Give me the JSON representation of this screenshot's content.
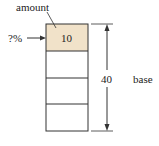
{
  "diagram": {
    "amount_label": "amount",
    "percent_label": "?%",
    "amount_value": "10",
    "base_value": "40",
    "base_label": "base",
    "rows": 4,
    "highlight_color": "#f1e2c9",
    "line_color": "#333333"
  }
}
